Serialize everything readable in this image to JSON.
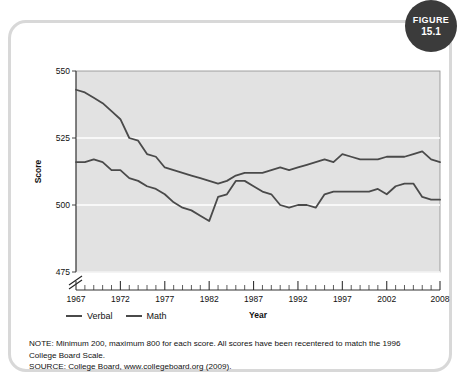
{
  "figure_badge": {
    "word": "FIGURE",
    "number": "15.1"
  },
  "chart_data": {
    "type": "line",
    "title": "",
    "xlabel": "Year",
    "ylabel": "Score",
    "xlim": [
      1967,
      2008
    ],
    "ylim": [
      475,
      550
    ],
    "yticks": [
      475,
      500,
      525,
      550
    ],
    "xticks": [
      1967,
      1972,
      1977,
      1982,
      1987,
      1992,
      1997,
      2002,
      2008
    ],
    "grid": "horizontal-white-lines",
    "axis_break": true,
    "legend_position": "below-axis-left",
    "x": [
      1967,
      1968,
      1969,
      1970,
      1971,
      1972,
      1973,
      1974,
      1975,
      1976,
      1977,
      1978,
      1979,
      1980,
      1981,
      1982,
      1983,
      1984,
      1985,
      1986,
      1987,
      1988,
      1989,
      1990,
      1991,
      1992,
      1993,
      1994,
      1995,
      1996,
      1997,
      1998,
      1999,
      2000,
      2001,
      2002,
      2003,
      2004,
      2005,
      2006,
      2007,
      2008
    ],
    "series": [
      {
        "name": "Verbal",
        "color": "#4a4a4a",
        "values": [
          516,
          516,
          517,
          516,
          513,
          513,
          510,
          509,
          507,
          506,
          504,
          501,
          499,
          498,
          496,
          494,
          503,
          504,
          509,
          509,
          507,
          505,
          504,
          500,
          499,
          500,
          500,
          499,
          504,
          505,
          505,
          505,
          505,
          505,
          506,
          504,
          507,
          508,
          508,
          503,
          502,
          502
        ]
      },
      {
        "name": "Math",
        "color": "#4a4a4a",
        "values": [
          543,
          542,
          540,
          538,
          535,
          532,
          525,
          524,
          519,
          518,
          514,
          513,
          512,
          511,
          510,
          509,
          508,
          509,
          511,
          512,
          512,
          512,
          513,
          514,
          513,
          514,
          515,
          516,
          517,
          516,
          519,
          518,
          517,
          517,
          517,
          518,
          518,
          518,
          519,
          520,
          517,
          516
        ]
      }
    ],
    "legend": [
      {
        "label": "Verbal"
      },
      {
        "label": "Math"
      }
    ]
  },
  "notes": {
    "line1": "NOTE: Minimum 200, maximum 800 for each score. All scores have been recentered to match the 1996",
    "line2": "College Board Scale.",
    "line3": "SOURCE: College Board, www.collegeboard.org (2009)."
  }
}
